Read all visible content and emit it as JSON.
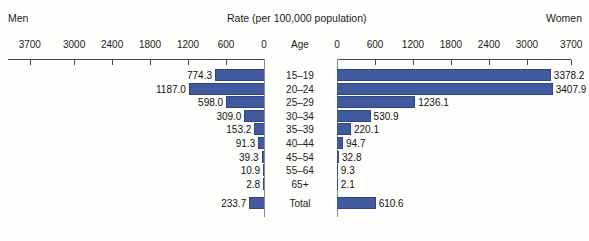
{
  "header": {
    "left_label": "Men",
    "title": "Rate (per 100,000 population)",
    "right_label": "Women",
    "center_column_label": "Age"
  },
  "axis": {
    "left_ticks": [
      "3700",
      "3000",
      "2400",
      "1800",
      "1200",
      "600",
      "0"
    ],
    "right_ticks": [
      "0",
      "600",
      "1200",
      "1800",
      "2400",
      "3000",
      "3700"
    ],
    "max": 3700,
    "unit_step": 600
  },
  "colors": {
    "bar_fill": "#41599e",
    "bar_stroke": "#2f4681",
    "axis": "#4a4a4a",
    "background": "#fdfdfb"
  },
  "chart_data": {
    "type": "bar",
    "title": "Rate (per 100,000 population)",
    "xlabel": "Rate (per 100,000 population)",
    "ylabel": "Age",
    "xlim": [
      0,
      3700
    ],
    "grid": false,
    "legend": [
      "Men",
      "Women"
    ],
    "legend_position": "top-outside",
    "orientation": "horizontal-diverging",
    "categories": [
      "15–19",
      "20–24",
      "25–29",
      "30–34",
      "35–39",
      "40–44",
      "45–54",
      "55–64",
      "65+",
      "Total"
    ],
    "series": [
      {
        "name": "Men",
        "side": "left",
        "values": [
          774.3,
          1187.0,
          598.0,
          309.0,
          153.2,
          91.3,
          39.3,
          10.9,
          2.8,
          233.7
        ],
        "labels": [
          "774.3",
          "1187.0",
          "598.0",
          "309.0",
          "153.2",
          "91.3",
          "39.3",
          "10.9",
          "2.8",
          "233.7"
        ]
      },
      {
        "name": "Women",
        "side": "right",
        "values": [
          3378.2,
          3407.9,
          1236.1,
          530.9,
          220.1,
          94.7,
          32.8,
          9.3,
          2.1,
          610.6
        ],
        "labels": [
          "3378.2",
          "3407.9",
          "1236.1",
          "530.9",
          "220.1",
          "94.7",
          "32.8",
          "9.3",
          "2.1",
          "610.6"
        ]
      }
    ]
  }
}
